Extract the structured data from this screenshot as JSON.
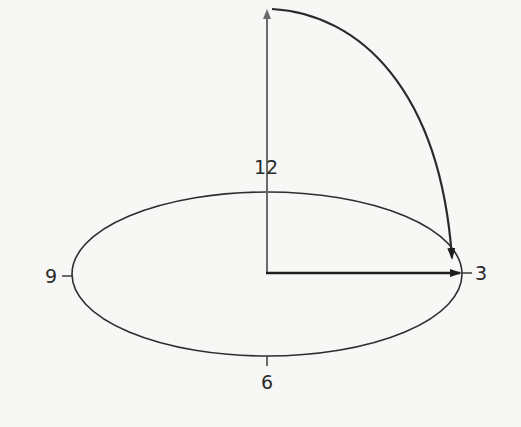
{
  "diagram": {
    "type": "clock-face rotation diagram",
    "labels": {
      "twelve": "12",
      "three": "3",
      "six": "6",
      "nine": "9"
    },
    "colors": {
      "background": "#f7f7f6",
      "ellipse": "#2e2e2e",
      "vertical_arrow": "#6a6a6a",
      "horizontal_arrow": "#1e1e1e",
      "rotation_arc": "#2a2a2a"
    }
  }
}
